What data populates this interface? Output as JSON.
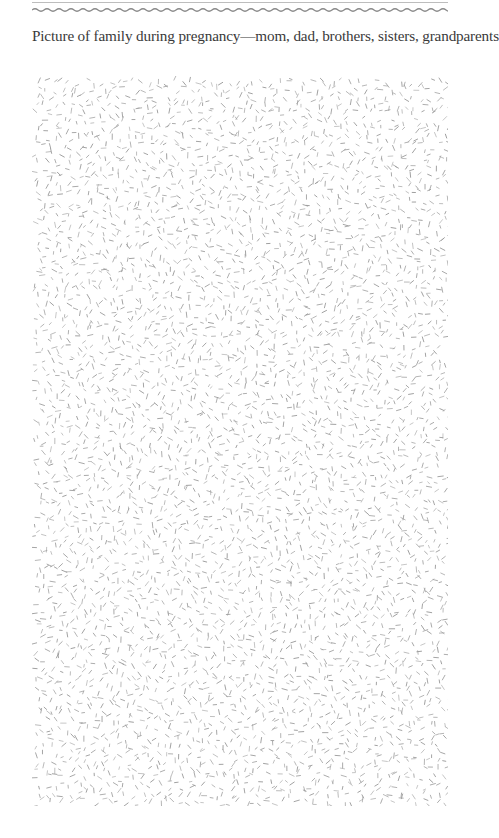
{
  "page": {
    "caption": "Picture of family during pregnancy—mom, dad, brothers, sisters, grandparents"
  },
  "decor": {
    "rule_color": "#bdbdbd",
    "wave_color": "#8a8a8a",
    "texture_color": "#9a9a9a"
  },
  "photo_area": {
    "label": "photo-placeholder",
    "pattern": "sprinkle-texture"
  }
}
